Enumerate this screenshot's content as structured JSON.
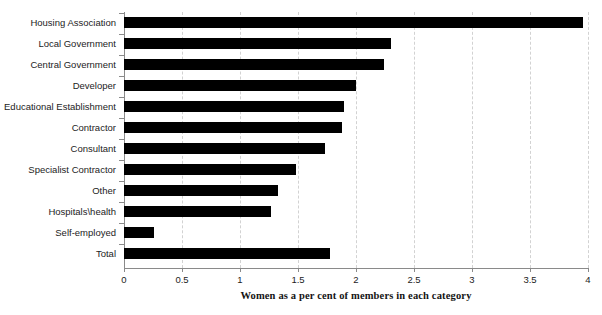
{
  "chart_data": {
    "type": "bar",
    "orientation": "horizontal",
    "title": "",
    "xlabel": "Women as a per cent of members in each category",
    "ylabel": "",
    "xlim": [
      0,
      4
    ],
    "xticks": [
      "0",
      "0.5",
      "1",
      "1.5",
      "2",
      "2.5",
      "3",
      "3.5",
      "4"
    ],
    "xtick_values": [
      0,
      0.5,
      1,
      1.5,
      2,
      2.5,
      3,
      3.5,
      4
    ],
    "grid": "vertical-dashed",
    "legend": "none",
    "bar_color": "#000000",
    "categories": [
      "Housing Association",
      "Local Government",
      "Central Government",
      "Developer",
      "Educational Establishment",
      "Contractor",
      "Consultant",
      "Specialist Contractor",
      "Other",
      "Hospitals\\health",
      "Self-employed",
      "Total"
    ],
    "values": [
      3.96,
      2.3,
      2.24,
      2.0,
      1.9,
      1.88,
      1.73,
      1.48,
      1.33,
      1.27,
      0.26,
      1.78
    ]
  }
}
